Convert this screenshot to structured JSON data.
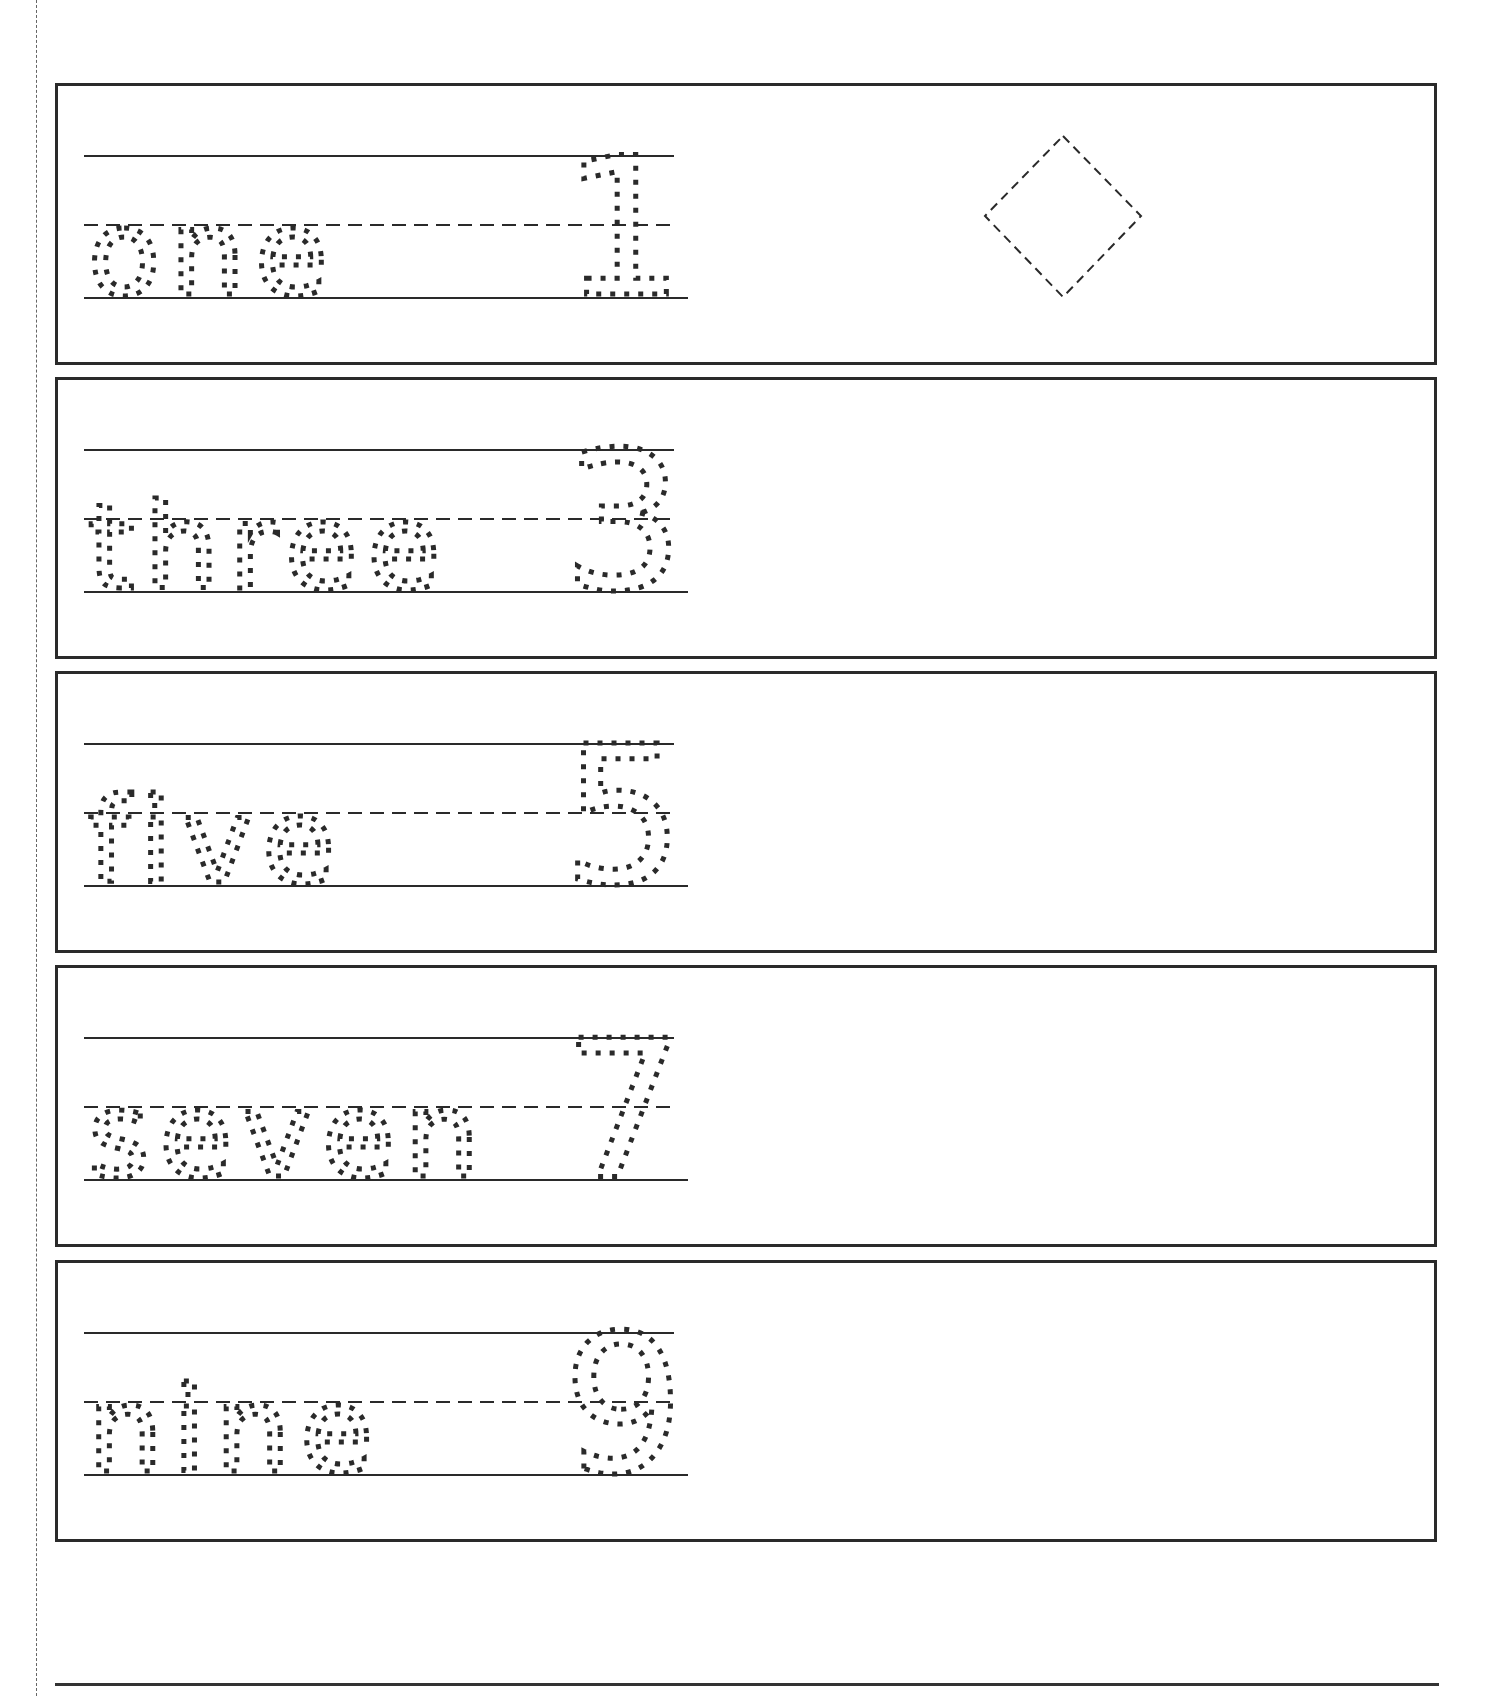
{
  "worksheet": {
    "rows": [
      {
        "word": "one",
        "numeral": "1",
        "shape": "diamond"
      },
      {
        "word": "three",
        "numeral": "3",
        "shape": null
      },
      {
        "word": "five",
        "numeral": "5",
        "shape": null
      },
      {
        "word": "seven",
        "numeral": "7",
        "shape": null
      },
      {
        "word": "nine",
        "numeral": "9",
        "shape": null
      }
    ]
  },
  "colors": {
    "ink": "#2a2a2a",
    "paper": "#ffffff"
  }
}
